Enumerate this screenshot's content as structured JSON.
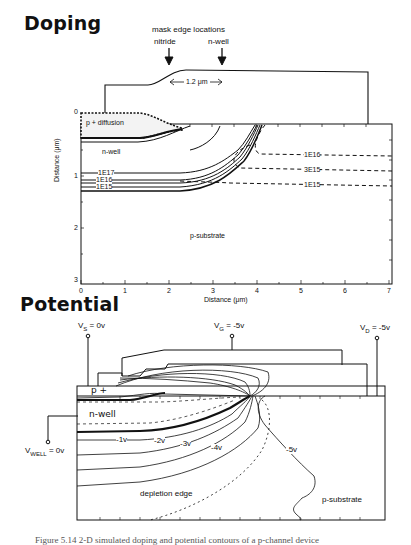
{
  "doping": {
    "title": "Doping",
    "mask_header": "mask edge locations",
    "mask_nitride": "nitride",
    "mask_nwell": "n-well",
    "dimension": "1.2 μm",
    "region_pdiffusion": "p + diffusion",
    "region_nwell": "n-well",
    "region_psubstrate": "p-substrate",
    "contours_solid": [
      "1E17",
      "1E16",
      "1E15"
    ],
    "contours_dashed": [
      "1E16",
      "3E15",
      "1E15"
    ],
    "y_axis_label": "Distance (μm)",
    "x_axis_label": "Distance (μm)",
    "y_ticks": [
      "0",
      "1",
      "2",
      "3"
    ],
    "x_ticks": [
      "0",
      "1",
      "2",
      "3",
      "4",
      "5",
      "6",
      "7"
    ]
  },
  "potential": {
    "title": "Potential",
    "vs": "Vs = 0v",
    "vs_main": "V",
    "vs_sub": "S",
    "vs_val": " = 0v",
    "vg_main": "V",
    "vg_sub": "G",
    "vg_val": " = -5v",
    "vd_main": "V",
    "vd_sub": "D",
    "vd_val": " = -5v",
    "vwell_main": "V",
    "vwell_sub": "WELL",
    "vwell_val": " = 0v",
    "region_pplus": "p +",
    "region_nwell": "n-well",
    "region_psubstrate": "p-substrate",
    "depletion_edge": "depletion edge",
    "contours": [
      "-1v",
      "-2v",
      "-3v",
      "-4v",
      "-5v"
    ]
  },
  "caption": "Figure 5.14  2-D simulated doping and potential contours of a p-channel device"
}
